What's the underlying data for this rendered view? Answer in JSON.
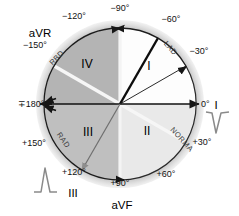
{
  "figure": {
    "center": {
      "x": 120,
      "y": 104
    },
    "radius": 76,
    "colors": {
      "quadrant_I_fill": "#fdfdfd",
      "quadrant_II_fill": "#e9e9e9",
      "quadrant_III_fill": "#bfbfbf",
      "quadrant_IV_fill": "#b4b4b4",
      "outer_ring": "#cfcfcf",
      "axis_line": "#111111",
      "divider_line": "#f2f2f2",
      "arrow": "#151515",
      "text": "#111111",
      "arc_text": "#3a3a3a",
      "waveform": "#7d7d7d"
    }
  },
  "degree_labels": [
    {
      "id": "minus-90",
      "text": "−90°",
      "x": 120,
      "y": 11,
      "anchor": "middle"
    },
    {
      "id": "minus-120",
      "text": "−120°",
      "x": 74,
      "y": 19,
      "anchor": "middle"
    },
    {
      "id": "minus-150",
      "text": "−150°",
      "x": 35,
      "y": 48,
      "anchor": "middle"
    },
    {
      "id": "minus-60",
      "text": "−60°",
      "x": 171,
      "y": 22,
      "anchor": "middle"
    },
    {
      "id": "minus-30",
      "text": "−30°",
      "x": 199,
      "y": 54,
      "anchor": "middle"
    },
    {
      "id": "zero",
      "text": "0°",
      "x": 201,
      "y": 105,
      "anchor": "start"
    },
    {
      "id": "plus-180",
      "text": "∓180°",
      "x": 31,
      "y": 106,
      "anchor": "middle"
    },
    {
      "id": "plus-150",
      "text": "+150°",
      "x": 34,
      "y": 146,
      "anchor": "middle"
    },
    {
      "id": "plus-120",
      "text": "+120°",
      "x": 74,
      "y": 175,
      "anchor": "middle"
    },
    {
      "id": "plus-90",
      "text": "+90°",
      "x": 120,
      "y": 186,
      "anchor": "middle"
    },
    {
      "id": "plus-60",
      "text": "+60°",
      "x": 166,
      "y": 177,
      "anchor": "middle"
    },
    {
      "id": "plus-30",
      "text": "+30°",
      "x": 202,
      "y": 145,
      "anchor": "middle"
    }
  ],
  "lead_labels": [
    {
      "id": "aVR",
      "text": "aVR",
      "x": 40,
      "y": 36,
      "anchor": "middle"
    },
    {
      "id": "aVF",
      "text": "aVF",
      "x": 122,
      "y": 208,
      "anchor": "middle"
    },
    {
      "id": "I",
      "text": "I",
      "x": 216,
      "y": 105,
      "anchor": "middle"
    },
    {
      "id": "III",
      "text": "III",
      "x": 73,
      "y": 196,
      "anchor": "middle"
    }
  ],
  "quadrants": [
    {
      "id": "quadrant-I",
      "roman": "I",
      "x": 149,
      "y": 70,
      "range": "0° to −90°",
      "fill": "#fdfdfd"
    },
    {
      "id": "quadrant-II",
      "roman": "II",
      "x": 147,
      "y": 135,
      "range": "0° to +90°",
      "fill": "#e9e9e9"
    },
    {
      "id": "quadrant-III",
      "roman": "III",
      "x": 88,
      "y": 136,
      "range": "+90° to ∓180°",
      "fill": "#bfbfbf"
    },
    {
      "id": "quadrant-IV",
      "roman": "IV",
      "x": 87,
      "y": 68,
      "range": "−90° to ∓180°",
      "fill": "#b4b4b4"
    }
  ],
  "arc_labels": [
    {
      "id": "lad",
      "text": "LAD",
      "description": "Left axis deviation arc, upper right"
    },
    {
      "id": "normal",
      "text": "NORMAL",
      "description": "Normal axis arc, lower right"
    },
    {
      "id": "rad",
      "text": "RAD",
      "description": "Right axis deviation arc, lower left"
    },
    {
      "id": "rbd",
      "text": "RBD",
      "description": "Extreme / indeterminate axis arc, upper left"
    }
  ],
  "waveforms": [
    {
      "id": "lead-I-qrs",
      "label": "I",
      "polarity": "negative",
      "x": 216,
      "y": 118
    },
    {
      "id": "lead-III-qrs",
      "label": "III",
      "polarity": "positive",
      "x": 44,
      "y": 182
    }
  ],
  "vectors": [
    {
      "id": "mean-axis-vector",
      "angle_deg": -60,
      "style": "thick-black"
    },
    {
      "id": "lad-boundary",
      "angle_deg": -30,
      "style": "thin-black"
    },
    {
      "id": "normal-boundary",
      "angle_deg": 30,
      "style": "thick-white"
    },
    {
      "id": "extreme-boundary",
      "angle_deg": -150,
      "style": "thick-white"
    }
  ]
}
